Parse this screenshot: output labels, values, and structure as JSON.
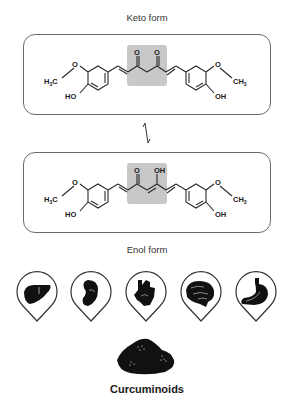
{
  "diagram": {
    "keto": {
      "caption": "Keto form",
      "highlight_atoms": [
        "O",
        "O"
      ],
      "substituents": {
        "left_methyl": "H3C",
        "left_hydroxyl": "HO",
        "right_methyl": "CH3",
        "right_hydroxyl": "OH",
        "ether_oxygen": "O"
      }
    },
    "equilibrium_arrow": "⇌",
    "enol": {
      "caption": "Enol form",
      "highlight_atoms": [
        "O",
        "OH"
      ],
      "substituents": {
        "left_methyl": "H3C",
        "left_hydroxyl": "HO",
        "right_methyl": "CH3",
        "right_hydroxyl": "OH",
        "ether_oxygen": "O"
      }
    },
    "organs": [
      {
        "name": "liver",
        "icon": "liver-icon"
      },
      {
        "name": "kidney",
        "icon": "kidney-icon"
      },
      {
        "name": "heart",
        "icon": "heart-icon"
      },
      {
        "name": "brain",
        "icon": "brain-icon"
      },
      {
        "name": "stomach",
        "icon": "stomach-icon"
      }
    ],
    "source_label": "Curcuminoids",
    "colors": {
      "highlight": "#c8c8c8",
      "border": "#6a6a6a",
      "ink": "#1a1a1a"
    }
  }
}
